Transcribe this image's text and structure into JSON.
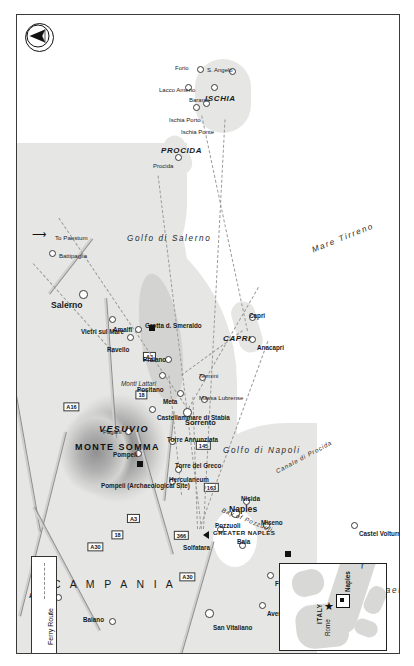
{
  "map": {
    "title": "Bay of Naples and Amalfi Coast",
    "region_label": "C A M P A N I A",
    "compass_icon": "north-arrow-icon",
    "frame_color": "#3a3a3a",
    "land_color": "#e6e6e4",
    "water_color": "#ffffff",
    "road_color": "#b9b9b9"
  },
  "legend": {
    "items": [
      {
        "label": "Ferry Route",
        "style": "dotted-line"
      }
    ]
  },
  "mountains": [
    {
      "name": "MONTE SOMMA"
    },
    {
      "name": "VESUVIO"
    },
    {
      "name": "Monti Lattari"
    }
  ],
  "water_labels": [
    {
      "name": "Golfo di Salerno"
    },
    {
      "name": "Golfo di Napoli"
    },
    {
      "name": "Golfo di Gaeta"
    },
    {
      "name": "Mare Tirreno"
    },
    {
      "name": "Bay of Pozzuoli"
    },
    {
      "name": "Canale di Procida"
    }
  ],
  "islands": [
    {
      "name": "CAPRI"
    },
    {
      "name": "ISCHIA"
    },
    {
      "name": "PROCIDA"
    }
  ],
  "areas": [
    {
      "name": "GREATER NAPLES"
    }
  ],
  "cities": [
    {
      "name": "Naples",
      "type": "major"
    },
    {
      "name": "Salerno",
      "type": "major"
    },
    {
      "name": "Sorrento",
      "type": "major"
    }
  ],
  "towns": [
    {
      "name": "Avellino"
    },
    {
      "name": "Baiano"
    },
    {
      "name": "San Vitaliano"
    },
    {
      "name": "Aversa"
    },
    {
      "name": "Frattamaggiore"
    },
    {
      "name": "Castel Volturno"
    },
    {
      "name": "Pozzuoli"
    },
    {
      "name": "Baia"
    },
    {
      "name": "Miseno"
    },
    {
      "name": "Nisida"
    },
    {
      "name": "Herculaneum"
    },
    {
      "name": "Torre del Greco"
    },
    {
      "name": "Torre Annunziata"
    },
    {
      "name": "Pompeii"
    },
    {
      "name": "Pagani"
    },
    {
      "name": "Castellammare di Stabia"
    },
    {
      "name": "Vietri sul Mare"
    },
    {
      "name": "Battipaglia"
    },
    {
      "name": "Ravello"
    },
    {
      "name": "Amalfi"
    },
    {
      "name": "Positano"
    },
    {
      "name": "Praiano"
    },
    {
      "name": "Meta"
    },
    {
      "name": "Termini"
    },
    {
      "name": "Massa Lubrense"
    },
    {
      "name": "Capri"
    },
    {
      "name": "Anacapri"
    },
    {
      "name": "Procida"
    },
    {
      "name": "Ischia Porto"
    },
    {
      "name": "Ischia Ponte"
    },
    {
      "name": "Barano"
    },
    {
      "name": "S. Angelo"
    },
    {
      "name": "Forio"
    },
    {
      "name": "Lacco Ameno"
    }
  ],
  "sites": [
    {
      "name": "Pompeii (Archaeological Site)",
      "marker": "black-square"
    },
    {
      "name": "Cuma (Archaeological Site)",
      "marker": "black-square"
    },
    {
      "name": "Grotta d. Smeraldo",
      "marker": "black-square"
    },
    {
      "name": "Solfatara",
      "marker": "black-triangle"
    }
  ],
  "roads": [
    {
      "number": "A30"
    },
    {
      "number": "A30"
    },
    {
      "number": "A16"
    },
    {
      "number": "A3"
    },
    {
      "number": "A3"
    },
    {
      "number": "18"
    },
    {
      "number": "18"
    },
    {
      "number": "366"
    },
    {
      "number": "163"
    },
    {
      "number": "145"
    }
  ],
  "direction_notes": [
    {
      "label": "To Paestum"
    }
  ],
  "inset": {
    "country_label": "ITALY",
    "capital": {
      "name": "Rome",
      "marker": "star"
    },
    "city": {
      "name": "Naples",
      "marker": "square"
    }
  }
}
